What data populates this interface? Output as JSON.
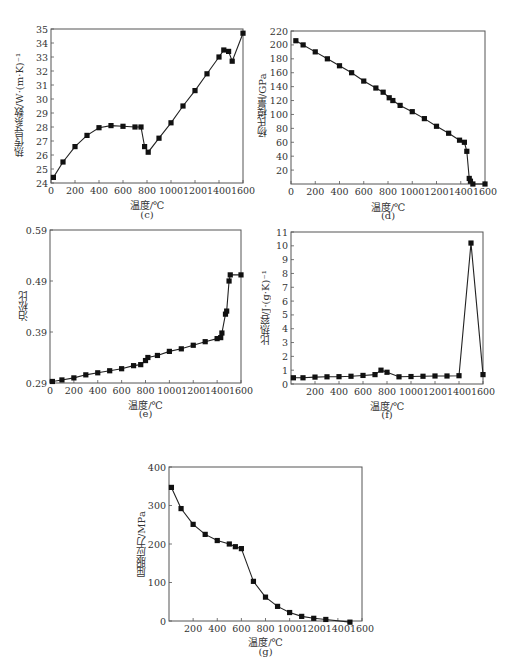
{
  "chart_data": [
    {
      "id": "c",
      "type": "line",
      "panel_label": "(c)",
      "title": "",
      "xlabel": "温度/℃",
      "ylabel": "热传导系数/W·(m·K)⁻¹",
      "xlim": [
        0,
        1600
      ],
      "ylim": [
        24,
        35
      ],
      "xticks": [
        0,
        200,
        400,
        600,
        800,
        1000,
        1200,
        1400,
        1600
      ],
      "yticks": [
        24,
        25,
        26,
        27,
        28,
        29,
        30,
        31,
        32,
        33,
        34,
        35
      ],
      "grid": false,
      "marker": "square",
      "x": [
        20,
        100,
        200,
        300,
        400,
        500,
        600,
        700,
        750,
        780,
        810,
        900,
        1000,
        1100,
        1200,
        1300,
        1400,
        1440,
        1480,
        1510,
        1600
      ],
      "values": [
        24.4,
        25.5,
        26.6,
        27.4,
        27.95,
        28.1,
        28.05,
        28.0,
        28.0,
        26.6,
        26.2,
        27.2,
        28.3,
        29.5,
        30.6,
        31.8,
        33.0,
        33.5,
        33.4,
        32.7,
        34.7
      ]
    },
    {
      "id": "d",
      "type": "line",
      "panel_label": "(d)",
      "title": "",
      "xlabel": "温度/℃",
      "ylabel": "杨氏模量/GPa",
      "xlim": [
        0,
        1600
      ],
      "ylim": [
        0,
        220
      ],
      "xticks": [
        0,
        200,
        400,
        600,
        800,
        1000,
        1200,
        1400,
        1600
      ],
      "yticks": [
        20,
        40,
        60,
        80,
        100,
        120,
        140,
        160,
        180,
        200,
        220
      ],
      "grid": false,
      "marker": "square",
      "x": [
        40,
        100,
        200,
        300,
        400,
        500,
        600,
        700,
        760,
        810,
        840,
        900,
        1000,
        1100,
        1200,
        1300,
        1390,
        1430,
        1450,
        1470,
        1480,
        1500,
        1600
      ],
      "values": [
        206,
        200,
        190,
        180,
        170,
        160,
        148,
        138,
        132,
        124,
        120,
        113,
        104,
        94,
        83,
        73,
        63,
        60,
        47,
        8,
        4,
        0,
        0
      ]
    },
    {
      "id": "e",
      "type": "line",
      "panel_label": "(e)",
      "title": "",
      "xlabel": "温度/℃",
      "ylabel": "泊松比",
      "xlim": [
        0,
        1600
      ],
      "ylim": [
        0.29,
        0.59
      ],
      "xticks": [
        0,
        200,
        400,
        600,
        800,
        1000,
        1200,
        1400,
        1600
      ],
      "yticks": [
        0.29,
        0.39,
        0.49,
        0.59
      ],
      "grid": false,
      "marker": "square",
      "x": [
        20,
        100,
        200,
        300,
        400,
        500,
        600,
        700,
        760,
        800,
        820,
        900,
        1000,
        1100,
        1200,
        1300,
        1400,
        1430,
        1440,
        1470,
        1480,
        1500,
        1510,
        1600
      ],
      "values": [
        0.293,
        0.296,
        0.3,
        0.306,
        0.31,
        0.314,
        0.318,
        0.324,
        0.326,
        0.334,
        0.34,
        0.344,
        0.352,
        0.357,
        0.364,
        0.371,
        0.377,
        0.379,
        0.388,
        0.425,
        0.431,
        0.49,
        0.502,
        0.502
      ]
    },
    {
      "id": "f",
      "type": "line",
      "panel_label": "(f)",
      "title": "",
      "xlabel": "温度/℃",
      "ylabel": "比热容/J·(g·K)⁻¹",
      "xlim": [
        0,
        1600
      ],
      "ylim": [
        0,
        11
      ],
      "xticks": [
        200,
        400,
        600,
        800,
        1000,
        1200,
        1400,
        1600
      ],
      "yticks": [
        0,
        1,
        2,
        3,
        4,
        5,
        6,
        7,
        8,
        9,
        10,
        11
      ],
      "grid": false,
      "marker": "square",
      "x": [
        20,
        100,
        200,
        300,
        400,
        500,
        600,
        700,
        750,
        800,
        900,
        1000,
        1100,
        1200,
        1300,
        1400,
        1500,
        1600
      ],
      "values": [
        0.45,
        0.45,
        0.5,
        0.52,
        0.53,
        0.56,
        0.62,
        0.68,
        1.0,
        0.85,
        0.52,
        0.54,
        0.56,
        0.58,
        0.58,
        0.6,
        10.2,
        0.68
      ]
    },
    {
      "id": "g",
      "type": "line",
      "panel_label": "(g)",
      "title": "",
      "xlabel": "温度/℃",
      "ylabel": "屈服应力/MPa",
      "xlim": [
        0,
        1600
      ],
      "ylim": [
        0,
        400
      ],
      "xticks": [
        200,
        400,
        600,
        800,
        1000,
        1200,
        1400,
        1600
      ],
      "yticks": [
        0,
        100,
        200,
        300,
        400
      ],
      "grid": false,
      "marker": "square",
      "x": [
        20,
        100,
        200,
        300,
        400,
        500,
        550,
        600,
        700,
        800,
        900,
        1000,
        1100,
        1200,
        1300,
        1500
      ],
      "values": [
        347,
        292,
        251,
        225,
        209,
        200,
        193,
        188,
        103,
        62,
        38,
        22,
        12,
        7,
        4,
        -3
      ]
    }
  ],
  "layout": {
    "line_color": "#222222",
    "frame_color": "#555555",
    "marker_color": "#111111"
  }
}
